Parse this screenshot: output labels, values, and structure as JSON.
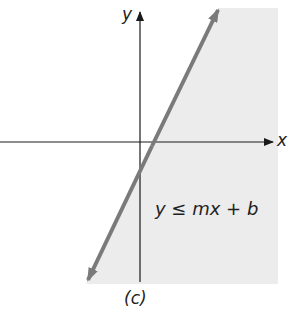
{
  "figure": {
    "caption": "(c)",
    "axis_labels": {
      "x": "x",
      "y": "y"
    },
    "inequality_label": "y ≤ mx + b",
    "colors": {
      "shade": "#ececec",
      "line": "#7a7a7a",
      "axes": "#1a1a1a"
    }
  }
}
